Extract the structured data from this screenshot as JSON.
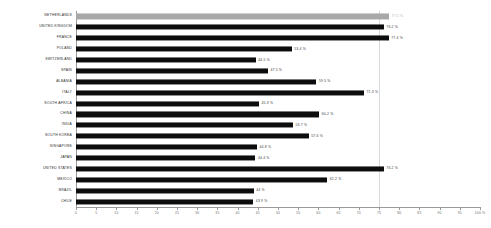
{
  "chart_data": {
    "type": "bar",
    "orientation": "horizontal",
    "title": "",
    "xlabel": "",
    "ylabel": "",
    "xlim": [
      0,
      100
    ],
    "xtick_step": 5,
    "grid": true,
    "gridline_at": 75,
    "value_suffix": " %",
    "highlight_index": 0,
    "colors": {
      "bar": "#0d0d0d",
      "bar_highlight": "#a8a8a8",
      "axis": "#9a9a9a",
      "grid": "#d8d8d8",
      "label": "#2b2b2b",
      "value": "#3a3a3a",
      "value_muted": "#b5b5b5",
      "background": "#ffffff"
    },
    "categories": [
      "NETHERLANDS",
      "UNITED KINGDOM",
      "FRANCE",
      "POLAND",
      "SWITZERLAND",
      "SPAIN",
      "ALBANIA",
      "ITALY",
      "SOUTH AFRICA",
      "CHINA",
      "INDIA",
      "SOUTH KOREA",
      "SINGAPORE",
      "JAPAN",
      "UNITED STATES",
      "MEXICO",
      "BRAZIL",
      "CHILE"
    ],
    "values": [
      77.5,
      76.2,
      77.4,
      53.4,
      44.5,
      47.5,
      59.5,
      71.3,
      45.3,
      60.2,
      53.7,
      57.6,
      44.8,
      44.4,
      76.2,
      62.2,
      44.0,
      43.9
    ],
    "value_labels": [
      "77.5 %",
      "76.2 %",
      "77.4 %",
      "53.4 %",
      "44.5 %",
      "47.5 %",
      "59.5 %",
      "71.3 %",
      "45.3 %",
      "60.2 %",
      "53.7 %",
      "57.6 %",
      "44.8 %",
      "44.4 %",
      "76.2 %",
      "62.2 %",
      "44 %",
      "43.9 %"
    ],
    "xtick_labels": [
      "0",
      "5",
      "10",
      "15",
      "20",
      "25",
      "30",
      "35",
      "40",
      "45",
      "50",
      "55",
      "60",
      "65",
      "70",
      "75",
      "80",
      "85",
      "90",
      "95",
      "100 %"
    ]
  }
}
